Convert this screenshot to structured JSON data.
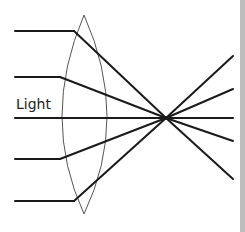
{
  "diagram": {
    "light_label": "Light",
    "element": "convex lens",
    "incoming_rays": 5,
    "focal_point": "single point on the optical axis behind the lens",
    "colors": {
      "ray": "#1a1a1a",
      "lens": "#555555",
      "edge_bar": "#bdbdbd"
    }
  }
}
